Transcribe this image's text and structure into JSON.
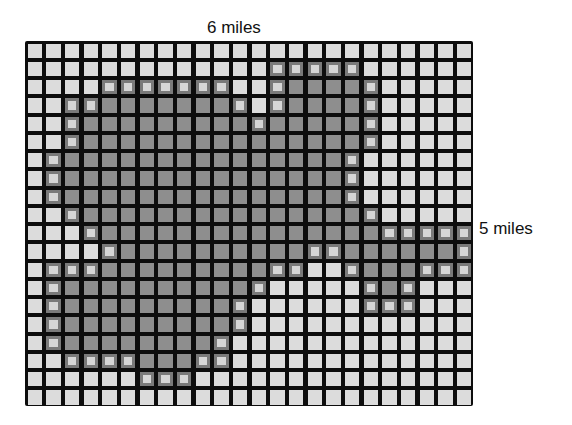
{
  "figure": {
    "type": "area-estimation-grid",
    "width_label": "6 miles",
    "height_label": "5 miles",
    "grid": {
      "columns": 24,
      "rows": 20
    },
    "colors": {
      "grid_line": "#0d0d0d",
      "empty_cell": "#dcdcdc",
      "shaded_cell": "#8e8e8e",
      "edge_cell": "#7a7a7a"
    },
    "shaded_rows": [
      [],
      [
        [
          13,
          17
        ]
      ],
      [
        [
          4,
          10
        ],
        [
          13,
          18
        ]
      ],
      [
        [
          2,
          11
        ],
        [
          13,
          18
        ]
      ],
      [
        [
          2,
          12
        ],
        [
          13,
          18
        ]
      ],
      [
        [
          2,
          18
        ]
      ],
      [
        [
          1,
          17
        ]
      ],
      [
        [
          1,
          17
        ]
      ],
      [
        [
          1,
          17
        ]
      ],
      [
        [
          2,
          18
        ]
      ],
      [
        [
          3,
          23
        ]
      ],
      [
        [
          4,
          23
        ]
      ],
      [
        [
          1,
          14
        ],
        [
          17,
          23
        ]
      ],
      [
        [
          1,
          12
        ],
        [
          18,
          20
        ]
      ],
      [
        [
          1,
          11
        ],
        [
          18,
          20
        ]
      ],
      [
        [
          1,
          11
        ]
      ],
      [
        [
          1,
          10
        ]
      ],
      [
        [
          2,
          10
        ]
      ],
      [
        [
          6,
          8
        ]
      ],
      []
    ]
  }
}
